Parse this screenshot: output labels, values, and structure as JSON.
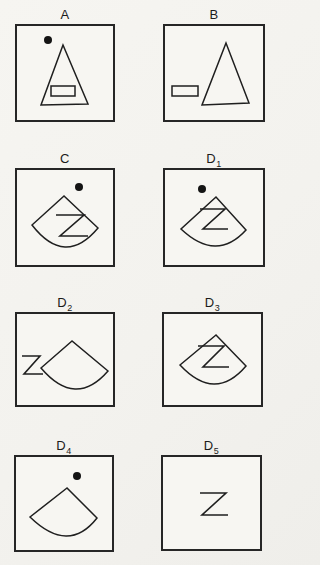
{
  "figure": {
    "description": "Eight labeled stimulus panels in a 2x4 grid, each a square frame containing line-drawn shapes",
    "ink_color": "#1f1f1f",
    "paper_color": "#f6f5f1",
    "frame_color": "#262626",
    "panels": [
      {
        "id": "A",
        "label": "A",
        "sub": "",
        "letter": "",
        "shapes": [
          "filled dot upper-left",
          "triangle",
          "small rectangle inside triangle"
        ]
      },
      {
        "id": "B",
        "label": "B",
        "sub": "",
        "letter": "",
        "shapes": [
          "small rectangle left of triangle",
          "triangle"
        ]
      },
      {
        "id": "C",
        "label": "C",
        "sub": "",
        "letter": "Z",
        "shapes": [
          "filled dot above fan",
          "fan sector",
          "letter Z inside fan"
        ]
      },
      {
        "id": "D1",
        "label": "D",
        "sub": "1",
        "letter": "Z",
        "shapes": [
          "filled dot above fan",
          "fan sector",
          "letter Z inside fan"
        ]
      },
      {
        "id": "D2",
        "label": "D",
        "sub": "2",
        "letter": "Z",
        "shapes": [
          "letter Z left of fan",
          "fan sector"
        ]
      },
      {
        "id": "D3",
        "label": "D",
        "sub": "3",
        "letter": "Z",
        "shapes": [
          "fan sector",
          "letter Z inside fan"
        ]
      },
      {
        "id": "D4",
        "label": "D",
        "sub": "4",
        "letter": "",
        "shapes": [
          "filled dot above fan",
          "fan sector"
        ]
      },
      {
        "id": "D5",
        "label": "D",
        "sub": "5",
        "letter": "Z",
        "shapes": [
          "letter Z centered alone"
        ]
      }
    ]
  }
}
